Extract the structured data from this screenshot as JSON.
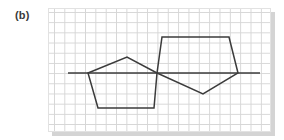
{
  "figure": {
    "label": "(b)"
  },
  "diagram": {
    "type": "reflection of shapes across a mirror line on grid paper",
    "colors": {
      "ink": "#3b3b3b",
      "grid": "#d6d6d6",
      "shadow": "#d4d4d4",
      "paper": "#ffffff"
    },
    "mirror_line": {
      "x1": 68,
      "y1": 73,
      "x2": 260,
      "y2": 73
    },
    "shapes": [
      {
        "name": "left-pentagon",
        "points": "88,73 127,57 157,73 154,108 98,108"
      },
      {
        "name": "right-pentagon",
        "points": "157,73 162,37 229,37 238,73 203,94"
      }
    ]
  }
}
